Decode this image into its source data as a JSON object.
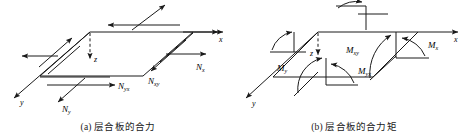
{
  "figure": {
    "panels": [
      {
        "id": "a",
        "caption": "(a) 层合板的合力",
        "axes": [
          {
            "name": "x-axis-label",
            "text": "x"
          },
          {
            "name": "y-axis-label",
            "text": "y"
          },
          {
            "name": "z-axis-label",
            "text": "z"
          }
        ],
        "force_labels": [
          {
            "name": "Nx",
            "symbol": "N",
            "subscript": "x"
          },
          {
            "name": "Ny",
            "symbol": "N",
            "subscript": "y"
          },
          {
            "name": "Nxy",
            "symbol": "N",
            "subscript": "xy"
          },
          {
            "name": "Nyx",
            "symbol": "N",
            "subscript": "yx"
          }
        ]
      },
      {
        "id": "b",
        "caption": "(b) 层合板的合力矩",
        "axes": [
          {
            "name": "x-axis-label",
            "text": "x"
          },
          {
            "name": "y-axis-label",
            "text": "y"
          },
          {
            "name": "z-axis-label",
            "text": "z"
          }
        ],
        "moment_labels": [
          {
            "name": "Mx",
            "symbol": "M",
            "subscript": "x"
          },
          {
            "name": "My",
            "symbol": "M",
            "subscript": "y"
          },
          {
            "name": "Mxy",
            "symbol": "M",
            "subscript": "xy"
          },
          {
            "name": "Myx",
            "symbol": "M",
            "subscript": "yx"
          }
        ]
      }
    ],
    "colors": {
      "line": "#1a1a1a",
      "background": "#ffffff"
    }
  }
}
